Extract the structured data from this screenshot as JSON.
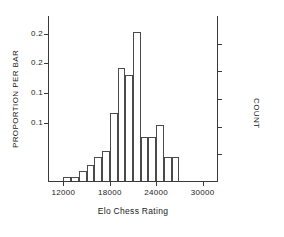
{
  "chart_data": {
    "type": "bar",
    "title": "",
    "xlabel": "Elo Chess Rating",
    "ylabel": "PROPORTION PER BAR",
    "y2label": "COUNT",
    "xlim": [
      10000,
      32000
    ],
    "ylim": [
      0,
      0.28
    ],
    "grid": false,
    "legend": false,
    "xticks": [
      "12000",
      "18000",
      "24000",
      "30000"
    ],
    "xtick_values": [
      12000,
      18000,
      24000,
      30000
    ],
    "yticks": [
      "0.2",
      "0.2",
      "0.1",
      "0.1"
    ],
    "ytick_values": [
      0.25,
      0.2,
      0.15,
      0.1
    ],
    "bin_width": 1000,
    "categories": [
      "12000",
      "13000",
      "14000",
      "15000",
      "16000",
      "17000",
      "18000",
      "19000",
      "20000",
      "21000",
      "22000",
      "23000",
      "24000",
      "25000",
      "26000"
    ],
    "bin_starts": [
      12000,
      13000,
      14000,
      15000,
      16000,
      17000,
      18000,
      19000,
      20000,
      21000,
      22000,
      23000,
      24000,
      25000,
      26000
    ],
    "values": [
      0.006,
      0.006,
      0.017,
      0.027,
      0.04,
      0.05,
      0.115,
      0.19,
      0.178,
      0.252,
      0.074,
      0.074,
      0.095,
      0.04,
      0.04
    ],
    "values_note": "proportion per bar read off left axis"
  },
  "axes": {
    "left_tick_labels": [
      "0.2",
      "0.2",
      "0.1",
      "0.1"
    ],
    "bottom_tick_labels": [
      "12000",
      "18000",
      "24000",
      "30000"
    ],
    "right_tick_count": 5
  },
  "titles": {
    "x_axis": "Elo Chess Rating",
    "y_axis_left": "PROPORTION PER BAR",
    "y_axis_right": "COUNT"
  },
  "style": {
    "line_color": "#4a4a4a",
    "axis_color": "#3a3a3a",
    "text_color": "#1a1a1a",
    "background": "#ffffff"
  }
}
